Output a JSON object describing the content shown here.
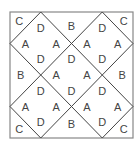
{
  "diagram": {
    "type": "square-tiling-layout",
    "frame": {
      "x": 10,
      "y": 12,
      "w": 123,
      "h": 126
    },
    "stroke_color": "#444444",
    "frame_color": "#888888",
    "labels": [
      {
        "t": "C",
        "x": 0.3,
        "y": 0.3
      },
      {
        "t": "D",
        "x": 1,
        "y": 0.5
      },
      {
        "t": "B",
        "x": 2,
        "y": 0.45
      },
      {
        "t": "D",
        "x": 3,
        "y": 0.5
      },
      {
        "t": "C",
        "x": 3.7,
        "y": 0.3
      },
      {
        "t": "A",
        "x": 0.5,
        "y": 1
      },
      {
        "t": "A",
        "x": 1.5,
        "y": 1
      },
      {
        "t": "A",
        "x": 2.5,
        "y": 1
      },
      {
        "t": "A",
        "x": 3.5,
        "y": 1
      },
      {
        "t": "D",
        "x": 1,
        "y": 1.5
      },
      {
        "t": "D",
        "x": 2,
        "y": 1.5
      },
      {
        "t": "D",
        "x": 3,
        "y": 1.5
      },
      {
        "t": "B",
        "x": 0.35,
        "y": 2
      },
      {
        "t": "A",
        "x": 1.5,
        "y": 2
      },
      {
        "t": "A",
        "x": 2.5,
        "y": 2
      },
      {
        "t": "B",
        "x": 3.65,
        "y": 2
      },
      {
        "t": "D",
        "x": 1,
        "y": 2.5
      },
      {
        "t": "D",
        "x": 2,
        "y": 2.5
      },
      {
        "t": "D",
        "x": 3,
        "y": 2.5
      },
      {
        "t": "A",
        "x": 0.5,
        "y": 3
      },
      {
        "t": "A",
        "x": 1.5,
        "y": 3
      },
      {
        "t": "A",
        "x": 2.5,
        "y": 3
      },
      {
        "t": "A",
        "x": 3.5,
        "y": 3
      },
      {
        "t": "C",
        "x": 0.3,
        "y": 3.7
      },
      {
        "t": "D",
        "x": 1,
        "y": 3.5
      },
      {
        "t": "B",
        "x": 2,
        "y": 3.55
      },
      {
        "t": "D",
        "x": 3,
        "y": 3.5
      },
      {
        "t": "C",
        "x": 3.7,
        "y": 3.7
      }
    ],
    "segments": [
      [
        1,
        0,
        0,
        1
      ],
      [
        3,
        0,
        0,
        3
      ],
      [
        4,
        1,
        1,
        4
      ],
      [
        4,
        3,
        3,
        4
      ],
      [
        3,
        0,
        4,
        1
      ],
      [
        1,
        0,
        4,
        3
      ],
      [
        0,
        1,
        3,
        4
      ],
      [
        0,
        3,
        1,
        4
      ]
    ]
  }
}
